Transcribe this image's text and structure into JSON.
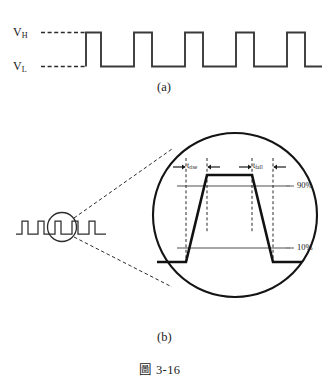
{
  "figure": {
    "number": "圖 3-16",
    "panels": [
      {
        "key": "a",
        "caption": "(a)"
      },
      {
        "key": "b",
        "caption": "(b)"
      }
    ]
  },
  "panel_a": {
    "voltage_high_label": "V",
    "voltage_high_sub": "H",
    "voltage_low_label": "V",
    "voltage_low_sub": "L",
    "pulse_count": 5,
    "waveform_description": "square-wave-clock"
  },
  "panel_b": {
    "rise_label": "t",
    "rise_sub": "rise",
    "fall_label": "t",
    "fall_sub": "fall",
    "upper_threshold": "90%",
    "lower_threshold": "10%",
    "small_waveform_pulses": 5,
    "magnifier": "circle-callout"
  },
  "colors": {
    "ink": "#1a1a1a",
    "trace": "#3a3a3a",
    "threshold_line": "#8a8a8a",
    "dashed": "#2b2b2b",
    "background": "#ffffff"
  }
}
